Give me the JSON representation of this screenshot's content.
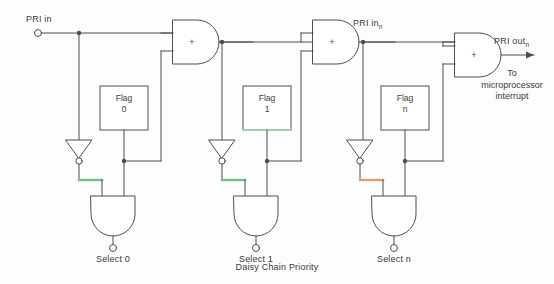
{
  "figure": {
    "caption": "Daisy Chain Priority",
    "caption_x": 277,
    "caption_y": 262,
    "width": 554,
    "height": 284,
    "background": "#fdfdfd",
    "wire_color": "#4d4d4d",
    "text_color": "#3a3a3a"
  },
  "labels": {
    "pri_in": "PRI in",
    "pri_in_n": "PRI in",
    "pri_in_n_sub": "n",
    "pri_out_n": "PRI out",
    "pri_out_n_sub": "n",
    "to_micro_line1": "To",
    "to_micro_line2": "microprocessor",
    "to_micro_line3": "interrupt",
    "and_gate_symbol": "+"
  },
  "stages": [
    {
      "id": "stage-0",
      "flag_line1": "Flag",
      "flag_line2": "0",
      "select_label": "Select 0",
      "highlight_color": "#6ec48a",
      "flag_box": {
        "x": 100,
        "y": 86,
        "w": 48,
        "h": 44
      },
      "flag_label_x": 124,
      "flag_label_y": 95,
      "inverter_x": 79,
      "inverter_top": 140,
      "inverter_bottom": 161,
      "select_x": 113,
      "select_y": 248,
      "and_gate_cx": 113,
      "and_gate_top": 196,
      "and_gate_bottom": 232,
      "highlight": {
        "x1": 82,
        "y1": 180,
        "x2": 102,
        "y2": 180
      }
    },
    {
      "id": "stage-1",
      "flag_line1": "Flag",
      "flag_line2": "1",
      "select_label": "Select 1",
      "highlight_color": "#6ec48a",
      "flag_box": {
        "x": 243,
        "y": 86,
        "w": 48,
        "h": 44
      },
      "flag_label_x": 267,
      "flag_label_y": 95,
      "inverter_x": 222,
      "inverter_top": 140,
      "inverter_bottom": 161,
      "select_x": 256,
      "select_y": 248,
      "and_gate_cx": 256,
      "and_gate_top": 196,
      "and_gate_bottom": 232,
      "highlight": {
        "x1": 225,
        "y1": 180,
        "x2": 245,
        "y2": 180
      }
    },
    {
      "id": "stage-n",
      "flag_line1": "Flag",
      "flag_line2": "n",
      "select_label": "Select n",
      "highlight_color": "#e0a066",
      "flag_box": {
        "x": 381,
        "y": 86,
        "w": 48,
        "h": 44
      },
      "flag_label_x": 405,
      "flag_label_y": 95,
      "inverter_x": 360,
      "inverter_top": 140,
      "inverter_bottom": 161,
      "select_x": 394,
      "select_y": 248,
      "and_gate_cx": 394,
      "and_gate_top": 196,
      "and_gate_bottom": 232,
      "highlight": {
        "x1": 363,
        "y1": 180,
        "x2": 383,
        "y2": 180
      }
    }
  ],
  "and_gates_main": [
    {
      "id": "and-gate-0",
      "x": 173,
      "y": 20,
      "w": 48,
      "h": 44
    },
    {
      "id": "and-gate-1",
      "x": 313,
      "y": 20,
      "w": 48,
      "h": 44
    },
    {
      "id": "and-gate-n",
      "x": 455,
      "y": 33,
      "w": 48,
      "h": 44
    }
  ],
  "terminals": {
    "pri_in_terminal_x": 38,
    "pri_in_terminal_y": 33,
    "pri_in_label_x": 26,
    "pri_in_label_y": 17,
    "pri_in_n_label_x": 353,
    "pri_in_n_label_y": 20,
    "pri_out_label_x": 493,
    "pri_out_label_y": 40,
    "to_micro_x": 512,
    "to_micro_y": 70
  }
}
